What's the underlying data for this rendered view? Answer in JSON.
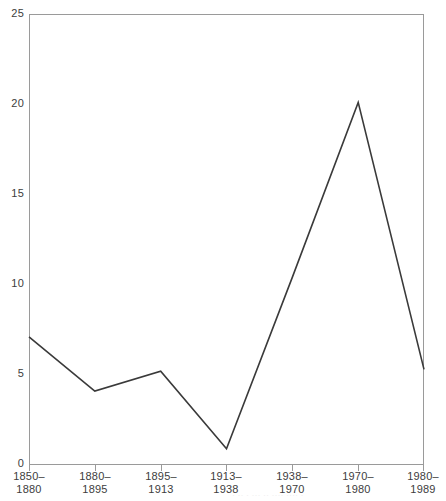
{
  "chart_data": {
    "type": "line",
    "title": "",
    "subtitle": "",
    "xlabel": "",
    "ylabel": "",
    "categories": [
      "1850–1880",
      "1880–1895",
      "1895–1913",
      "1913–1938",
      "1938–1970",
      "1970–1980",
      "1980–1989"
    ],
    "category_lines": [
      [
        "1850–",
        "1880"
      ],
      [
        "1880–",
        "1895"
      ],
      [
        "1895–",
        "1913"
      ],
      [
        "1913–",
        "1938"
      ],
      [
        "1938–",
        "1970"
      ],
      [
        "1970–",
        "1980"
      ],
      [
        "1980–",
        "1989"
      ]
    ],
    "values": [
      7.1,
      4.1,
      5.2,
      0.9,
      10.4,
      20.1,
      5.3
    ],
    "vertices": [
      7.1,
      4.1,
      5.2,
      0.9,
      20.1,
      5.3
    ],
    "vertex_categories": [
      "1850–1880",
      "1880–1895",
      "1895–1913",
      "1913–1938",
      "1970–1980",
      "1980–1989"
    ],
    "ylim": [
      0,
      25
    ],
    "xlim": [
      0,
      6
    ],
    "yticks": [
      0,
      5,
      10,
      15,
      20,
      25
    ],
    "ytick_labels": [
      "0",
      "5",
      "10",
      "15",
      "20",
      "25"
    ],
    "grid": false,
    "legend": false,
    "legend_position": "none",
    "series": [
      {
        "name": "",
        "color": "#3a3a3a",
        "values": [
          7.1,
          4.1,
          5.2,
          0.9,
          10.4,
          20.1,
          5.3
        ]
      }
    ],
    "annotations": []
  },
  "axes": {
    "y_tick_labels": [
      "25",
      "20",
      "15",
      "10",
      "5",
      "0"
    ],
    "x_tick_labels": [
      {
        "top": "1850–",
        "bottom": "1880"
      },
      {
        "top": "1880–",
        "bottom": "1895"
      },
      {
        "top": "1895–",
        "bottom": "1913"
      },
      {
        "top": "1913–",
        "bottom": "1938"
      },
      {
        "top": "1938–",
        "bottom": "1970"
      },
      {
        "top": "1970–",
        "bottom": "1980"
      },
      {
        "top": "1980–",
        "bottom": "1989"
      }
    ]
  },
  "style": {
    "line_color": "#3a3a3a",
    "frame_color": "#9a9a9a",
    "text_color": "#3d3d3d",
    "background": "#ffffff"
  },
  "footer": {
    "caption_remnant": "· ·· · ··· ·· ···· ···· ·"
  }
}
